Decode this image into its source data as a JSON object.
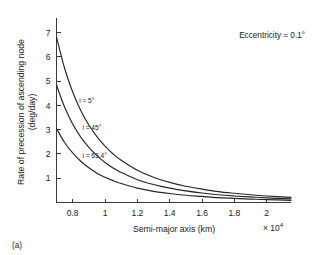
{
  "panel_label": "(a)",
  "annotation": "Eccentricity = 0.1°",
  "chart_data": {
    "type": "line",
    "title": "",
    "xlabel": "Semi-major axis (km)",
    "ylabel": "Rate of precession of ascending node (deg/day)",
    "ylabel_line1": "Rate of precession of ascending node",
    "ylabel_line2": "(deg/day)",
    "x_multiplier": "× 10",
    "x_multiplier_exp": "4",
    "x_multiplier_full": "× 10⁴",
    "xlim": [
      0.7,
      2.15
    ],
    "ylim": [
      0,
      7.6
    ],
    "grid": false,
    "legend": "inline-curve-labels",
    "xticks": [
      0.8,
      1,
      1.2,
      1.4,
      1.6,
      1.8,
      2
    ],
    "xticklabels": [
      "0.8",
      "1",
      "1.2",
      "1.4",
      "1.6",
      "1.8",
      "2"
    ],
    "yticks": [
      1,
      2,
      3,
      4,
      5,
      6,
      7
    ],
    "yticklabels": [
      "1",
      "2",
      "3",
      "4",
      "5",
      "6",
      "7"
    ],
    "annotations": [
      "Eccentricity = 0.1°"
    ],
    "series": [
      {
        "name": "i = 5°",
        "label": "i = 5°",
        "label_x": 0.84,
        "label_y": 4.1,
        "color": "#262626",
        "x": [
          0.7,
          0.75,
          0.8,
          0.85,
          0.9,
          0.95,
          1.0,
          1.05,
          1.1,
          1.2,
          1.3,
          1.4,
          1.5,
          1.6,
          1.7,
          1.8,
          1.9,
          2.0,
          2.15
        ],
        "y": [
          6.82,
          5.53,
          4.55,
          3.79,
          3.19,
          2.71,
          2.32,
          2.0,
          1.74,
          1.33,
          1.04,
          0.83,
          0.67,
          0.55,
          0.45,
          0.38,
          0.32,
          0.27,
          0.21
        ]
      },
      {
        "name": "i = 45°",
        "label": "i = 45°",
        "label_x": 0.86,
        "label_y": 3.0,
        "color": "#262626",
        "x": [
          0.7,
          0.75,
          0.8,
          0.85,
          0.9,
          0.95,
          1.0,
          1.05,
          1.1,
          1.2,
          1.3,
          1.4,
          1.5,
          1.6,
          1.7,
          1.8,
          1.9,
          2.0,
          2.15
        ],
        "y": [
          4.84,
          3.93,
          3.23,
          2.69,
          2.27,
          1.93,
          1.65,
          1.42,
          1.24,
          0.94,
          0.74,
          0.59,
          0.48,
          0.39,
          0.32,
          0.27,
          0.23,
          0.19,
          0.15
        ]
      },
      {
        "name": "i = 63.4°",
        "label": "i = 63.4°",
        "label_x": 0.86,
        "label_y": 1.82,
        "color": "#262626",
        "x": [
          0.7,
          0.75,
          0.8,
          0.85,
          0.9,
          0.95,
          1.0,
          1.05,
          1.1,
          1.2,
          1.3,
          1.4,
          1.5,
          1.6,
          1.7,
          1.8,
          1.9,
          2.0,
          2.15
        ],
        "y": [
          3.05,
          2.47,
          2.04,
          1.7,
          1.43,
          1.21,
          1.04,
          0.9,
          0.78,
          0.59,
          0.46,
          0.37,
          0.3,
          0.25,
          0.2,
          0.17,
          0.14,
          0.12,
          0.09
        ]
      }
    ]
  }
}
